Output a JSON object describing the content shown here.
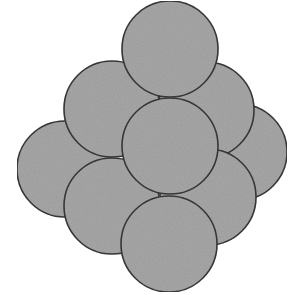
{
  "diagram": {
    "title": "",
    "fill_color": "#a9a9a9",
    "stroke_color": "#3a3a3a",
    "background": "#ffffff",
    "circles": [
      {
        "id": "far-left",
        "cx": 65,
        "cy": 169,
        "r": 48
      },
      {
        "id": "far-right",
        "cx": 239,
        "cy": 152,
        "r": 48
      },
      {
        "id": "upper-left",
        "cx": 112,
        "cy": 109,
        "r": 48
      },
      {
        "id": "upper-right",
        "cx": 206,
        "cy": 110,
        "r": 48
      },
      {
        "id": "lower-left",
        "cx": 112,
        "cy": 206,
        "r": 48
      },
      {
        "id": "lower-right",
        "cx": 208,
        "cy": 197,
        "r": 48
      },
      {
        "id": "top",
        "cx": 170,
        "cy": 49,
        "r": 48
      },
      {
        "id": "center",
        "cx": 170,
        "cy": 146,
        "r": 48
      },
      {
        "id": "bottom",
        "cx": 169,
        "cy": 244,
        "r": 48
      }
    ]
  }
}
